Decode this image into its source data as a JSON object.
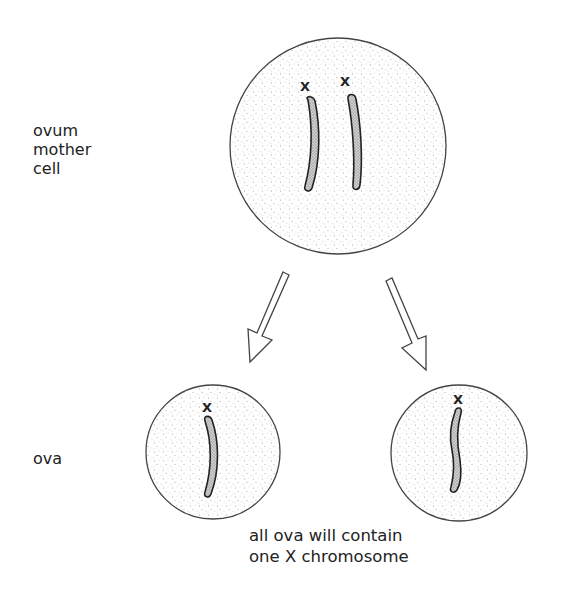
{
  "labels": {
    "mother_cell": [
      "ovum",
      "mother",
      "cell"
    ],
    "ova": "ova"
  },
  "caption": {
    "line1": "all ova will contain",
    "line2": "one X chromosome"
  },
  "chromosome_marks": {
    "mother_left": "X",
    "mother_right": "X",
    "ovum_left": "X",
    "ovum_right": "X"
  },
  "colors": {
    "outline": "#444444",
    "stipple": "#9a9a9a",
    "chromosome_fill": "#b8b8b8",
    "text": "#222222"
  }
}
